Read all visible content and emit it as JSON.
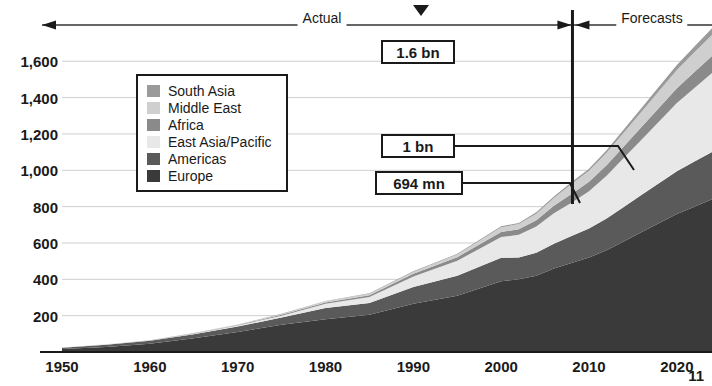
{
  "page": {
    "page_number": "11"
  },
  "axes": {
    "y_ticks": [
      "1,600",
      "1,400",
      "1,200",
      "1,000",
      "800",
      "600",
      "400",
      "200"
    ],
    "y_tick_values": [
      1600,
      1400,
      1200,
      1000,
      800,
      600,
      400,
      200
    ],
    "x_ticks": [
      "1950",
      "1960",
      "1970",
      "1980",
      "1990",
      "2000",
      "2010",
      "2020"
    ],
    "x_tick_values": [
      1950,
      1960,
      1970,
      1980,
      1990,
      2000,
      2010,
      2020
    ]
  },
  "periods": {
    "actual_label": "Actual",
    "forecast_label": "Forecasts",
    "divider_year": 2008
  },
  "callouts": [
    {
      "id": "callout-1-6bn",
      "text": "1.6 bn"
    },
    {
      "id": "callout-1bn",
      "text": "1 bn"
    },
    {
      "id": "callout-694mn",
      "text": "694 mn"
    }
  ],
  "legend": {
    "items": [
      {
        "label": "South Asia",
        "color": "#9a9a9a"
      },
      {
        "label": "Middle East",
        "color": "#cfcfcf"
      },
      {
        "label": "Africa",
        "color": "#8a8a8a"
      },
      {
        "label": "East Asia/Pacific",
        "color": "#e8e8e8"
      },
      {
        "label": "Americas",
        "color": "#5a5a5a"
      },
      {
        "label": "Europe",
        "color": "#3a3a3a"
      }
    ]
  },
  "chart_data": {
    "type": "area",
    "stacked": true,
    "title": "",
    "subtitle": "",
    "xlabel": "",
    "ylabel": "",
    "xlim": [
      1950,
      2024
    ],
    "ylim": [
      0,
      1750
    ],
    "grid": true,
    "legend_position": "inside-upper-left",
    "unit": "millions of international tourist arrivals",
    "annotations": [
      {
        "text": "1.6 bn",
        "note": "forecast total around 2020",
        "value": 1600
      },
      {
        "text": "1 bn",
        "note": "forecast total around 2012",
        "value": 1000
      },
      {
        "text": "694 mn",
        "note": "actual total at 2008",
        "value": 694
      }
    ],
    "x": [
      1950,
      1955,
      1960,
      1965,
      1970,
      1975,
      1980,
      1985,
      1990,
      1995,
      2000,
      2002,
      2004,
      2006,
      2008,
      2010,
      2012,
      2014,
      2016,
      2018,
      2020,
      2022,
      2024
    ],
    "series": [
      {
        "name": "Europe",
        "color": "#3a3a3a",
        "values": [
          17,
          28,
          45,
          75,
          110,
          150,
          180,
          205,
          265,
          310,
          390,
          400,
          420,
          460,
          490,
          520,
          560,
          610,
          660,
          710,
          760,
          800,
          840
        ]
      },
      {
        "name": "Americas",
        "color": "#5a5a5a",
        "values": [
          7,
          12,
          17,
          22,
          30,
          40,
          62,
          65,
          93,
          109,
          128,
          120,
          126,
          136,
          148,
          160,
          175,
          190,
          205,
          220,
          235,
          248,
          260
        ]
      },
      {
        "name": "East Asia/Pacific",
        "color": "#e8e8e8",
        "values": [
          0.2,
          0.6,
          1,
          3,
          6,
          10,
          23,
          33,
          57,
          83,
          115,
          125,
          145,
          168,
          184,
          205,
          235,
          270,
          305,
          340,
          375,
          405,
          435
        ]
      },
      {
        "name": "Africa",
        "color": "#8a8a8a",
        "values": [
          0.5,
          1,
          1,
          2,
          3,
          5,
          7,
          9,
          15,
          20,
          28,
          30,
          34,
          41,
          47,
          52,
          58,
          64,
          70,
          76,
          82,
          88,
          94
        ]
      },
      {
        "name": "Middle East",
        "color": "#cfcfcf",
        "values": [
          0.2,
          0.4,
          0.6,
          1.5,
          2,
          3,
          7,
          8,
          10,
          14,
          25,
          29,
          36,
          42,
          55,
          60,
          68,
          76,
          84,
          92,
          100,
          108,
          116
        ]
      },
      {
        "name": "South Asia",
        "color": "#9a9a9a",
        "values": [
          0.2,
          0.3,
          0.5,
          0.8,
          1,
          2,
          2,
          3,
          4,
          4,
          6,
          6,
          8,
          9,
          10,
          12,
          14,
          17,
          20,
          24,
          28,
          32,
          36
        ]
      }
    ]
  }
}
